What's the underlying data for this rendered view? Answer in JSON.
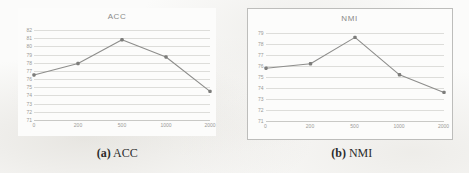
{
  "figure": {
    "panels": [
      {
        "caption_tag": "(a)",
        "caption_text": "ACC",
        "title": "ACC"
      },
      {
        "caption_tag": "(b)",
        "caption_text": "NMI",
        "title": "NMI"
      }
    ]
  },
  "colors": {
    "line": "#8d8d8b",
    "marker": "#7d7d7b",
    "grid": "#ddddda",
    "axis": "#c9c9c6",
    "tick_text": "#9a9a97",
    "title_text": "#8a8a88",
    "caption_text": "#2b2b2b",
    "page_background": "#fbfbfa"
  },
  "chart_data": [
    {
      "type": "line",
      "title": "ACC",
      "xlabel": "",
      "ylabel": "",
      "categories": [
        "0",
        "200",
        "500",
        "1000",
        "2000"
      ],
      "x": [
        0,
        200,
        500,
        1000,
        2000
      ],
      "values": [
        76.5,
        77.9,
        80.8,
        78.7,
        74.5
      ],
      "yticks": [
        82,
        81,
        80,
        79,
        78,
        77,
        76,
        75,
        74,
        73,
        72,
        71
      ],
      "ylim": [
        71,
        82
      ],
      "grid": true,
      "legend": "none",
      "markers": true
    },
    {
      "type": "line",
      "title": "NMI",
      "xlabel": "",
      "ylabel": "",
      "categories": [
        "0",
        "200",
        "500",
        "1000",
        "2000"
      ],
      "x": [
        0,
        200,
        500,
        1000,
        2000
      ],
      "values": [
        75.8,
        76.2,
        78.6,
        75.2,
        73.6
      ],
      "yticks": [
        79,
        78,
        77,
        76,
        75,
        74,
        73,
        72,
        71
      ],
      "ylim": [
        71,
        79
      ],
      "grid": true,
      "legend": "none",
      "markers": true
    }
  ]
}
